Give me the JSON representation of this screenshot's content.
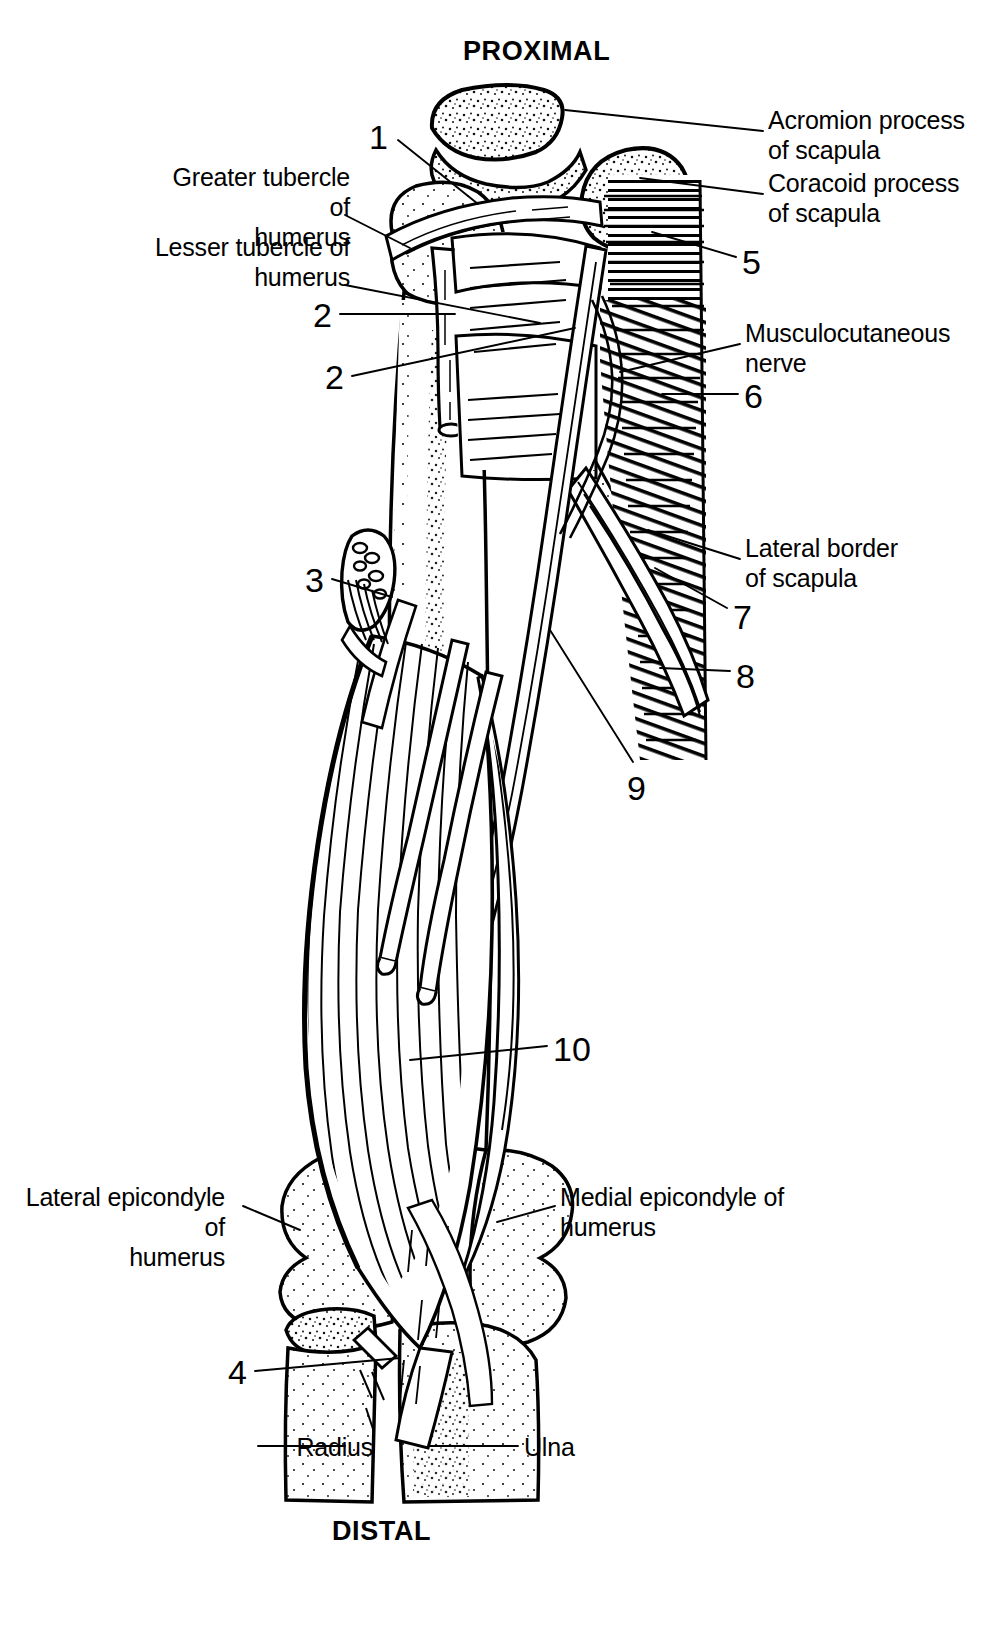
{
  "figure": {
    "type": "anatomical-illustration",
    "background_color": "#ffffff",
    "ink_color": "#000000"
  },
  "orientation": {
    "top_label": "PROXIMAL",
    "bottom_label": "DISTAL"
  },
  "text_labels": [
    {
      "id": "acromion",
      "text": "Acromion process\nof scapula",
      "side": "right",
      "x": 768,
      "y": 105,
      "leader_from": [
        763,
        131
      ],
      "leader_to": [
        565,
        110
      ]
    },
    {
      "id": "coracoid",
      "text": "Coracoid process\nof scapula",
      "side": "right",
      "x": 768,
      "y": 168,
      "leader_from": [
        763,
        194
      ],
      "leader_to": [
        640,
        178
      ]
    },
    {
      "id": "greater-tubercle",
      "text": "Greater tubercle of\nhumerus",
      "side": "left",
      "x": 155,
      "y": 162,
      "leader_from": [
        345,
        215
      ],
      "leader_to": [
        410,
        248
      ]
    },
    {
      "id": "lesser-tubercle",
      "text": "Lesser tubercle of\nhumerus",
      "side": "left",
      "x": 155,
      "y": 232,
      "leader_from": [
        345,
        285
      ],
      "leader_to": [
        540,
        323
      ]
    },
    {
      "id": "musculocutaneous",
      "text": "Musculocutaneous\nnerve",
      "side": "right",
      "x": 745,
      "y": 318,
      "leader_from": [
        740,
        344
      ],
      "leader_to": [
        620,
        372
      ]
    },
    {
      "id": "lateral-border",
      "text": "Lateral border\nof scapula",
      "side": "right",
      "x": 745,
      "y": 533,
      "leader_from": [
        740,
        559
      ],
      "leader_to": [
        648,
        530
      ]
    },
    {
      "id": "lateral-epi",
      "text": "Lateral epicondyle of\nhumerus",
      "side": "left",
      "x": 30,
      "y": 1182,
      "leader_from": [
        243,
        1206
      ],
      "leader_to": [
        300,
        1230
      ]
    },
    {
      "id": "medial-epi",
      "text": "Medial epicondyle of\nhumerus",
      "side": "right",
      "x": 560,
      "y": 1182,
      "leader_from": [
        555,
        1206
      ],
      "leader_to": [
        497,
        1222
      ]
    },
    {
      "id": "radius",
      "text": "Radius",
      "side": "left",
      "x": 178,
      "y": 1432,
      "leader_from": [
        258,
        1446
      ],
      "leader_to": [
        345,
        1446
      ]
    },
    {
      "id": "ulna",
      "text": "Ulna",
      "side": "right",
      "x": 524,
      "y": 1432,
      "leader_from": [
        518,
        1446
      ],
      "leader_to": [
        430,
        1446
      ]
    }
  ],
  "numbered_leaders": [
    {
      "number": "1",
      "x": 369,
      "y": 120,
      "leader_from": [
        398,
        140
      ],
      "leader_to": [
        478,
        204
      ]
    },
    {
      "number": "2",
      "x": 313,
      "y": 298,
      "leader_from": [
        340,
        314
      ],
      "leader_to": [
        455,
        314
      ]
    },
    {
      "number": "2",
      "x": 325,
      "y": 360,
      "leader_from": [
        352,
        376
      ],
      "leader_to": [
        575,
        328
      ]
    },
    {
      "number": "3",
      "x": 305,
      "y": 563,
      "leader_from": [
        332,
        579
      ],
      "leader_to": [
        392,
        597
      ]
    },
    {
      "number": "4",
      "x": 228,
      "y": 1355,
      "leader_from": [
        255,
        1371
      ],
      "leader_to": [
        400,
        1358
      ]
    },
    {
      "number": "5",
      "x": 742,
      "y": 245,
      "leader_from": [
        736,
        257
      ],
      "leader_to": [
        652,
        232
      ]
    },
    {
      "number": "6",
      "x": 744,
      "y": 379,
      "leader_from": [
        738,
        394
      ],
      "leader_to": [
        662,
        394
      ]
    },
    {
      "number": "7",
      "x": 733,
      "y": 600,
      "leader_from": [
        727,
        608
      ],
      "leader_to": [
        655,
        568
      ]
    },
    {
      "number": "8",
      "x": 736,
      "y": 659,
      "leader_from": [
        730,
        671
      ],
      "leader_to": [
        660,
        668
      ]
    },
    {
      "number": "9",
      "x": 627,
      "y": 771,
      "leader_from": [
        633,
        762
      ],
      "leader_to": [
        550,
        630
      ]
    },
    {
      "number": "10",
      "x": 553,
      "y": 1032,
      "leader_from": [
        547,
        1046
      ],
      "leader_to": [
        410,
        1060
      ]
    }
  ]
}
